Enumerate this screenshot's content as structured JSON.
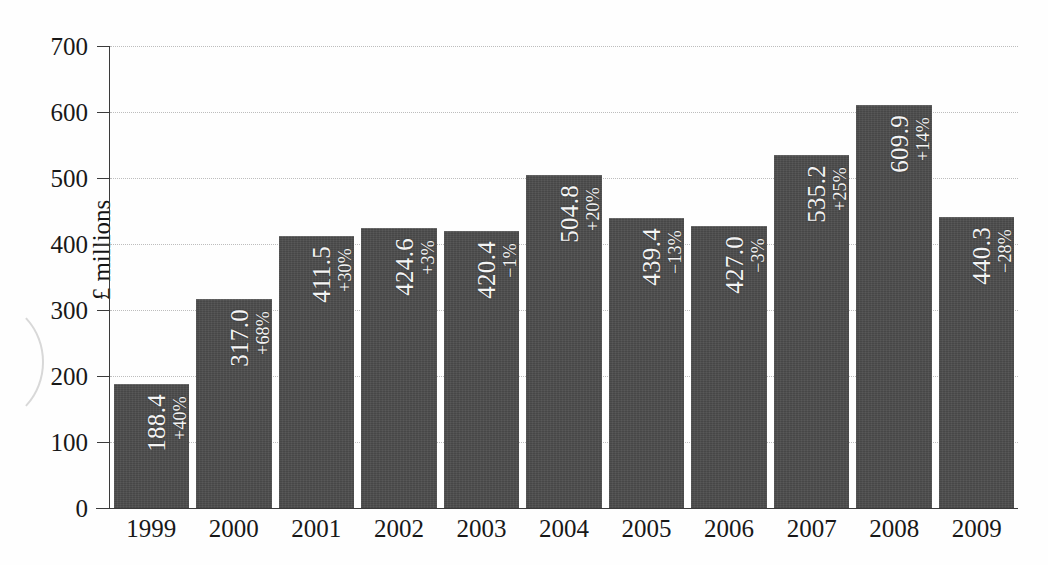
{
  "chart_data": {
    "type": "bar",
    "title": "",
    "xlabel": "",
    "ylabel": "£ millions",
    "categories": [
      "1999",
      "2000",
      "2001",
      "2002",
      "2003",
      "2004",
      "2005",
      "2006",
      "2007",
      "2008",
      "2009"
    ],
    "values": [
      188.4,
      317.0,
      411.5,
      424.6,
      420.4,
      504.8,
      439.4,
      427.0,
      535.2,
      609.9,
      440.3
    ],
    "value_labels": [
      "188.4",
      "317.0",
      "411.5",
      "424.6",
      "420.4",
      "504.8",
      "439.4",
      "427.0",
      "535.2",
      "609.9",
      "440.3"
    ],
    "change_labels": [
      "+40%",
      "+68%",
      "+30%",
      "+3%",
      "-1%",
      "+20%",
      "-13%",
      "-3%",
      "+25%",
      "+14%",
      "-28%"
    ],
    "ylim": [
      0,
      700
    ],
    "yticks": [
      0,
      100,
      200,
      300,
      400,
      500,
      600,
      700
    ],
    "ytick_labels": [
      "0",
      "100",
      "200",
      "300",
      "400",
      "500",
      "600",
      "700"
    ],
    "grid": true,
    "legend": false,
    "bar_color": "#4b4b4b",
    "label_color": "#f4f4f4",
    "gridline_color": "#bdbdbd",
    "axis_color": "#3b3b3b"
  }
}
